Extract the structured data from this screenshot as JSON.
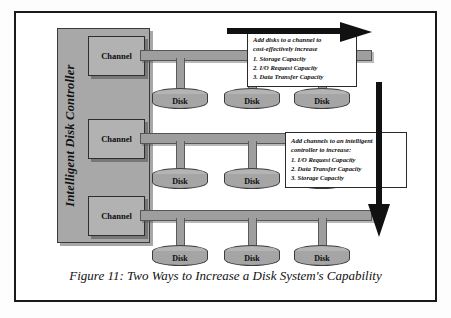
{
  "figure": {
    "caption": "Figure 11: Two Ways to Increase a Disk System's Capability",
    "controller_label": "Intelligent Disk Controller"
  },
  "channels": [
    {
      "label": "Channel"
    },
    {
      "label": "Channel"
    },
    {
      "label": "Channel"
    }
  ],
  "disk_rows": [
    {
      "disks": [
        {
          "label": "Disk"
        },
        {
          "label": "Disk"
        },
        {
          "label": "Disk"
        }
      ]
    },
    {
      "disks": [
        {
          "label": "Disk"
        },
        {
          "label": "Disk"
        },
        {
          "label": "Disk"
        }
      ]
    },
    {
      "disks": [
        {
          "label": "Disk"
        },
        {
          "label": "Disk"
        },
        {
          "label": "Disk"
        }
      ]
    }
  ],
  "callouts": [
    {
      "id": "add-disks",
      "lead_line_1": "Add disks to a channel to",
      "lead_line_2": "cost-effectively increase",
      "items": [
        "1.  Storage Capacity",
        "2.  I/O Request Capacity",
        "3.  Data Transfer Capacity"
      ]
    },
    {
      "id": "add-channels",
      "lead_line_1": "Add channels to an intelligent",
      "lead_line_2": "controller to increase:",
      "items": [
        "1.  I/O Request Capacity",
        "2.  Data Transfer Capacity",
        "3.  Storage Capacity"
      ]
    }
  ],
  "arrows": [
    {
      "name": "horizontal-growth-arrow",
      "direction": "right"
    },
    {
      "name": "vertical-growth-arrow",
      "direction": "down"
    }
  ],
  "colors": {
    "border": "#1a1a1a",
    "controller_fill": "#a8a8a8",
    "channel_fill": "#b2b2b2",
    "bus_fill": "#9e9e9e",
    "disk_fill": "#a5a5a5",
    "arrow": "#111111",
    "page": "#ffffff"
  }
}
